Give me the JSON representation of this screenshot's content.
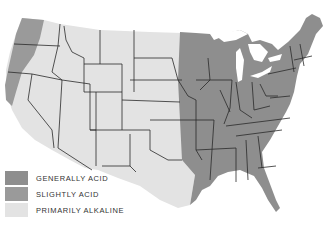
{
  "map": {
    "subject": "United States soil reaction map",
    "colors": {
      "generally_acid": "#8e8e8e",
      "slightly_acid": "#9a9a9a",
      "primarily_alkaline": "#e3e3e3",
      "borders": "#2a2a2a",
      "water": "#ffffff"
    }
  },
  "legend": {
    "items": [
      {
        "label": "GENERALLY ACID",
        "color": "#8e8e8e"
      },
      {
        "label": "SLIGHTLY ACID",
        "color": "#9a9a9a"
      },
      {
        "label": "PRIMARILY ALKALINE",
        "color": "#e3e3e3"
      }
    ]
  }
}
